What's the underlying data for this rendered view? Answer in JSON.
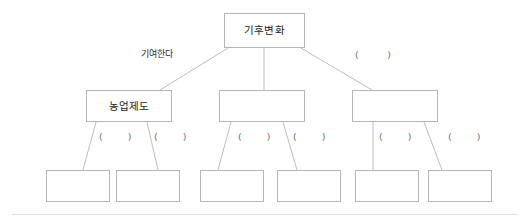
{
  "diagram": {
    "type": "concept-map-tree",
    "title_node": "기후변화",
    "blank_marker": "(        )",
    "blank_marker_short": "(       )",
    "colors": {
      "box_border": "#b5b5b5",
      "edge_stroke": "#bdbdbd",
      "text": "#1c1c1c",
      "background": "#ffffff",
      "footer_rule": "#e2e2e2"
    },
    "levels": {
      "top": {
        "nodes": [
          {
            "id": "root",
            "label": "기후변화",
            "filled": true
          }
        ]
      },
      "middle": {
        "nodes": [
          {
            "id": "mid-1",
            "label": "농업제도",
            "filled": true
          },
          {
            "id": "mid-2",
            "label": "",
            "filled": false
          },
          {
            "id": "mid-3",
            "label": "",
            "filled": false
          }
        ]
      },
      "bottom": {
        "nodes": [
          {
            "id": "leaf-1",
            "label": "",
            "filled": false
          },
          {
            "id": "leaf-2",
            "label": "",
            "filled": false
          },
          {
            "id": "leaf-3",
            "label": "",
            "filled": false
          },
          {
            "id": "leaf-4",
            "label": "",
            "filled": false
          },
          {
            "id": "leaf-5",
            "label": "",
            "filled": false
          },
          {
            "id": "leaf-6",
            "label": "",
            "filled": false
          }
        ]
      }
    },
    "edge_labels": {
      "top_left": "기여한다",
      "top_right": "(        )",
      "mid1_left": "(       )",
      "mid1_right": "(       )",
      "mid2_left": "(       )",
      "mid2_right": "(       )",
      "mid3_left": "(       )",
      "mid3_right": "(       )"
    }
  }
}
